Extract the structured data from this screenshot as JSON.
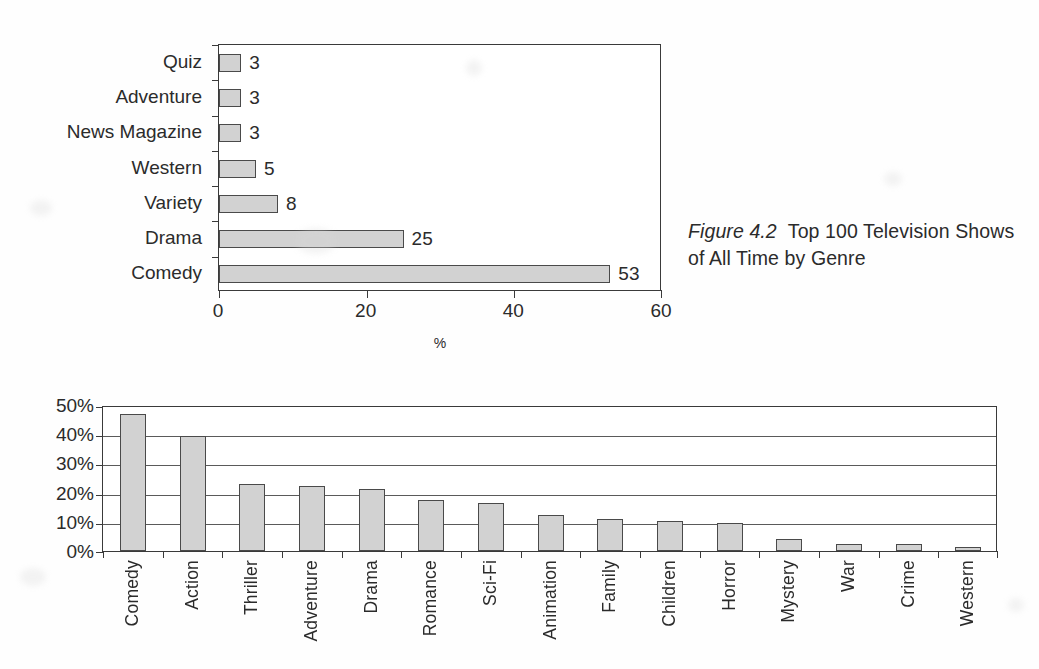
{
  "caption": {
    "figure_label": "Figure 4.2",
    "text": "Top 100 Television Shows of All Time by Genre"
  },
  "chart_data": [
    {
      "id": "top-100-tv-shows-by-genre",
      "type": "bar",
      "orientation": "horizontal",
      "title": "",
      "xlabel": "%",
      "ylabel": "",
      "xlim": [
        0,
        60
      ],
      "xticks": [
        "0",
        "20",
        "40",
        "60"
      ],
      "grid": false,
      "legend": "none",
      "categories": [
        "Comedy",
        "Drama",
        "Variety",
        "Western",
        "News Magazine",
        "Adventure",
        "Quiz"
      ],
      "values": [
        53,
        25,
        8,
        5,
        3,
        3,
        3
      ],
      "data_labels": [
        "53",
        "25",
        "8",
        "5",
        "3",
        "3",
        "3"
      ],
      "bar_fill": "#d2d2d2",
      "bar_border": "#4a4a4a"
    },
    {
      "id": "movie-genre-preferences",
      "type": "bar",
      "orientation": "vertical",
      "title": "",
      "xlabel": "",
      "ylabel": "",
      "ylim": [
        0,
        50
      ],
      "yticks": [
        "0%",
        "10%",
        "20%",
        "30%",
        "40%",
        "50%"
      ],
      "grid": true,
      "legend": "none",
      "categories": [
        "Comedy",
        "Action",
        "Thriller",
        "Adventure",
        "Drama",
        "Romance",
        "Sci-Fi",
        "Animation",
        "Family",
        "Children",
        "Horror",
        "Mystery",
        "War",
        "Crime",
        "Western"
      ],
      "values": [
        47,
        39.5,
        22.8,
        22.3,
        21.3,
        17.5,
        16.3,
        12.5,
        11,
        10.3,
        9.5,
        4,
        2.5,
        2.5,
        1.3
      ],
      "bar_fill": "#d2d2d2",
      "bar_border": "#4a4a4a"
    }
  ]
}
